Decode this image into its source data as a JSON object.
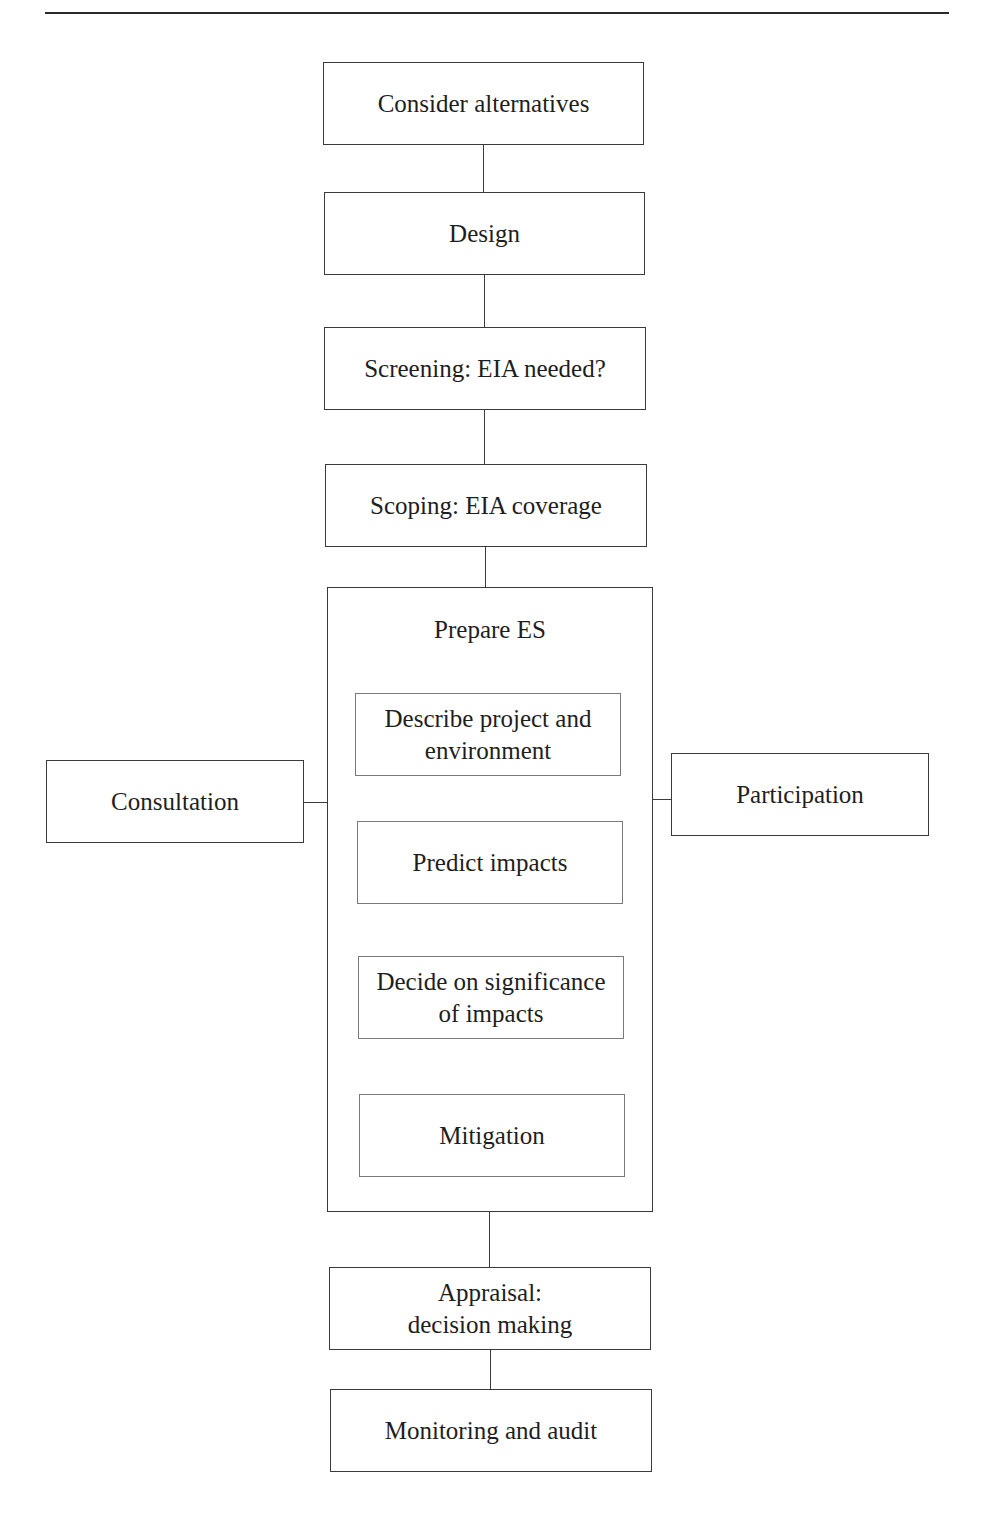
{
  "figure": {
    "header_rule": true,
    "steps": {
      "consider_alternatives": "Consider alternatives",
      "design": "Design",
      "screening": "Screening: EIA needed?",
      "scoping": "Scoping: EIA coverage",
      "prepare_es": {
        "title": "Prepare ES",
        "substeps": [
          "Describe project and\nenvironment",
          "Predict impacts",
          "Decide on significance\nof impacts",
          "Mitigation"
        ]
      },
      "appraisal": "Appraisal:\ndecision making",
      "monitoring": "Monitoring and audit"
    },
    "side_inputs": {
      "left": "Consultation",
      "right": "Participation"
    },
    "colors": {
      "outer_border": "#3a3a3a",
      "inner_border": "#7a7a7a",
      "text": "#1e1e1e",
      "background": "#ffffff"
    }
  }
}
